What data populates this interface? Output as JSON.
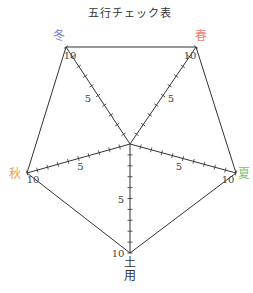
{
  "title": "五行チェック表",
  "chart_data": {
    "type": "radar",
    "title": "五行チェック表",
    "axes": [
      {
        "name": "春",
        "color": "#f08070",
        "vertex": [
          196,
          47
        ]
      },
      {
        "name": "夏",
        "color": "#7cc060",
        "vertex": [
          236,
          173
        ]
      },
      {
        "name": "土用",
        "color": "#333333",
        "vertex": [
          130,
          253
        ]
      },
      {
        "name": "秋",
        "color": "#f0a050",
        "vertex": [
          27,
          173
        ]
      },
      {
        "name": "冬",
        "color": "#8080d0",
        "vertex": [
          66,
          47
        ]
      }
    ],
    "center": [
      130,
      144
    ],
    "scale": {
      "min": 0,
      "max": 10,
      "ticks_per_axis": 10,
      "labeled_ticks": [
        5,
        10
      ]
    },
    "values": [],
    "grid": false,
    "legend": "none"
  },
  "labels": {
    "spring": "春",
    "summer": "夏",
    "doyo_top": "土",
    "doyo_bottom": "用",
    "autumn": "秋",
    "winter": "冬",
    "tick5": "5",
    "tick10": "10"
  }
}
